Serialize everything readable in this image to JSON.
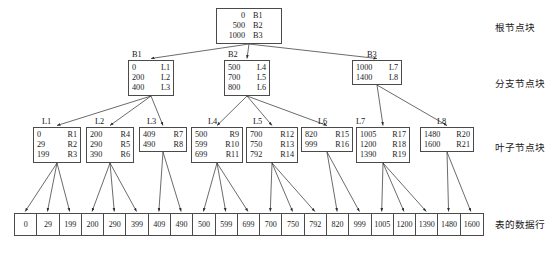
{
  "diagram": {
    "title_present": false,
    "side_labels": [
      {
        "id": "root-block",
        "text": "根节点块",
        "x": 495,
        "y": 22
      },
      {
        "id": "branch-block",
        "text": "分支节点块",
        "x": 495,
        "y": 78
      },
      {
        "id": "leaf-block",
        "text": "叶子节点块",
        "x": 495,
        "y": 142
      },
      {
        "id": "datarow-block",
        "text": "表的数据行",
        "x": 495,
        "y": 219
      }
    ],
    "root": {
      "name": "root",
      "x": 216,
      "y": 8,
      "w": 66,
      "rows": [
        {
          "key": "0",
          "value": "B1"
        },
        {
          "key": "500",
          "value": "B2"
        },
        {
          "key": "1000",
          "value": "B3"
        }
      ]
    },
    "branches": [
      {
        "name": "B1",
        "label_x": 132,
        "label_y": 50,
        "x": 128,
        "y": 60,
        "w": 46,
        "rows": [
          {
            "key": "0",
            "value": "L1"
          },
          {
            "key": "200",
            "value": "L2"
          },
          {
            "key": "400",
            "value": "L3"
          }
        ]
      },
      {
        "name": "B2",
        "label_x": 228,
        "label_y": 50,
        "x": 224,
        "y": 60,
        "w": 46,
        "rows": [
          {
            "key": "500",
            "value": "L4"
          },
          {
            "key": "700",
            "value": "L5"
          },
          {
            "key": "800",
            "value": "L6"
          }
        ]
      },
      {
        "name": "B3",
        "label_x": 367,
        "label_y": 50,
        "x": 352,
        "y": 60,
        "w": 50,
        "rows": [
          {
            "key": "1000",
            "value": "L7"
          },
          {
            "key": "1400",
            "value": "L8"
          }
        ]
      }
    ],
    "leaves": [
      {
        "name": "L1",
        "label_x": 42,
        "label_y": 117,
        "x": 33,
        "y": 127,
        "w": 48,
        "rows": [
          {
            "key": "0",
            "value": "R1"
          },
          {
            "key": "29",
            "value": "R2"
          },
          {
            "key": "199",
            "value": "R3"
          }
        ]
      },
      {
        "name": "L2",
        "label_x": 95,
        "label_y": 117,
        "x": 86,
        "y": 127,
        "w": 48,
        "rows": [
          {
            "key": "200",
            "value": "R4"
          },
          {
            "key": "290",
            "value": "R5"
          },
          {
            "key": "390",
            "value": "R6"
          }
        ]
      },
      {
        "name": "L3",
        "label_x": 147,
        "label_y": 117,
        "x": 139,
        "y": 127,
        "w": 48,
        "rows": [
          {
            "key": "409",
            "value": "R7"
          },
          {
            "key": "490",
            "value": "R8"
          }
        ]
      },
      {
        "name": "L4",
        "label_x": 208,
        "label_y": 117,
        "x": 191,
        "y": 127,
        "w": 52,
        "rows": [
          {
            "key": "500",
            "value": "R9"
          },
          {
            "key": "599",
            "value": "R10"
          },
          {
            "key": "699",
            "value": "R11"
          }
        ]
      },
      {
        "name": "L5",
        "label_x": 253,
        "label_y": 117,
        "x": 246,
        "y": 127,
        "w": 52,
        "rows": [
          {
            "key": "700",
            "value": "R12"
          },
          {
            "key": "750",
            "value": "R13"
          },
          {
            "key": "792",
            "value": "R14"
          }
        ]
      },
      {
        "name": "L6",
        "label_x": 318,
        "label_y": 117,
        "x": 301,
        "y": 127,
        "w": 52,
        "rows": [
          {
            "key": "820",
            "value": "R15"
          },
          {
            "key": "999",
            "value": "R16"
          }
        ]
      },
      {
        "name": "L7",
        "label_x": 356,
        "label_y": 117,
        "x": 356,
        "y": 127,
        "w": 54,
        "rows": [
          {
            "key": "1005",
            "value": "R17"
          },
          {
            "key": "1200",
            "value": "R18"
          },
          {
            "key": "1390",
            "value": "R19"
          }
        ]
      },
      {
        "name": "L8",
        "label_x": 437,
        "label_y": 117,
        "x": 420,
        "y": 127,
        "w": 54,
        "rows": [
          {
            "key": "1480",
            "value": "R20"
          },
          {
            "key": "1600",
            "value": "R21"
          }
        ]
      }
    ],
    "data_row": {
      "x": 14,
      "y": 213,
      "cell_count": 21,
      "cells": [
        "0",
        "29",
        "199",
        "200",
        "290",
        "399",
        "409",
        "490",
        "500",
        "599",
        "699",
        "700",
        "750",
        "792",
        "820",
        "999",
        "1005",
        "1200",
        "1390",
        "1480",
        "1600"
      ]
    },
    "edges": [
      {
        "from": "root",
        "to": "B1"
      },
      {
        "from": "root",
        "to": "B2"
      },
      {
        "from": "root",
        "to": "B3"
      },
      {
        "from": "B1",
        "to": "L1"
      },
      {
        "from": "B1",
        "to": "L2"
      },
      {
        "from": "B1",
        "to": "L3"
      },
      {
        "from": "B2",
        "to": "L4"
      },
      {
        "from": "B2",
        "to": "L5"
      },
      {
        "from": "B2",
        "to": "L6"
      },
      {
        "from": "B3",
        "to": "L7"
      },
      {
        "from": "B3",
        "to": "L8"
      },
      {
        "from": "L1",
        "to": "cell0"
      },
      {
        "from": "L1",
        "to": "cell1"
      },
      {
        "from": "L1",
        "to": "cell2"
      },
      {
        "from": "L2",
        "to": "cell3"
      },
      {
        "from": "L2",
        "to": "cell4"
      },
      {
        "from": "L2",
        "to": "cell5"
      },
      {
        "from": "L3",
        "to": "cell6"
      },
      {
        "from": "L3",
        "to": "cell7"
      },
      {
        "from": "L4",
        "to": "cell8"
      },
      {
        "from": "L4",
        "to": "cell9"
      },
      {
        "from": "L4",
        "to": "cell10"
      },
      {
        "from": "L5",
        "to": "cell11"
      },
      {
        "from": "L5",
        "to": "cell12"
      },
      {
        "from": "L5",
        "to": "cell13"
      },
      {
        "from": "L6",
        "to": "cell14"
      },
      {
        "from": "L6",
        "to": "cell15"
      },
      {
        "from": "L7",
        "to": "cell16"
      },
      {
        "from": "L7",
        "to": "cell17"
      },
      {
        "from": "L7",
        "to": "cell18"
      },
      {
        "from": "L8",
        "to": "cell19"
      },
      {
        "from": "L8",
        "to": "cell20"
      }
    ],
    "colors": {
      "stroke": "#4a4a4a",
      "text": "#1a1a1a",
      "background": "#ffffff"
    }
  }
}
